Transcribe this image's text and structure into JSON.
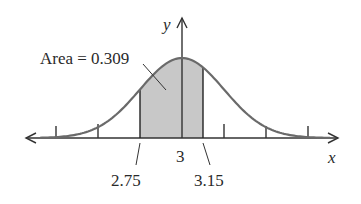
{
  "figure": {
    "type": "normal-distribution-diagram",
    "annotation": "Area = 0.309",
    "axis_labels": {
      "x": "x",
      "y": "y"
    },
    "tick_labels": {
      "mean": "3",
      "lower_bound": "2.75",
      "upper_bound": "3.15"
    },
    "shaded_region": {
      "from": 2.75,
      "to": 3.15,
      "area": 0.309
    },
    "colors": {
      "curve": "#6a6a6a",
      "shade": "#c8c8c8",
      "axis": "#333333",
      "text": "#2a2a2a"
    }
  },
  "chart_data": {
    "type": "area",
    "title": "",
    "mean": 3,
    "shaded_interval": [
      2.75,
      3.15
    ],
    "shaded_area": 0.309,
    "xlabel": "x",
    "ylabel": "y",
    "x_tick_labels": [
      "2.75",
      "3",
      "3.15"
    ],
    "annotations": [
      "Area = 0.309"
    ],
    "tick_marks_count": 6,
    "grid": false
  }
}
